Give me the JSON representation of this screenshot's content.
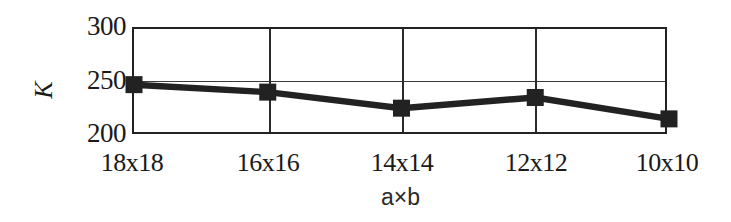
{
  "chart_data": {
    "type": "line",
    "title": "",
    "subtitle": "",
    "xlabel": "a×b",
    "ylabel": "K",
    "categories": [
      "18x18",
      "16x16",
      "14x14",
      "12x12",
      "10x10"
    ],
    "series": [
      {
        "name": "K",
        "values": [
          248,
          241,
          226,
          236,
          216
        ],
        "marker": "filled-square",
        "line_color": "#222222",
        "marker_color": "#222222"
      }
    ],
    "ylim": [
      200,
      300
    ],
    "yticks": [
      200,
      250,
      300
    ],
    "ytick_labels": [
      "200",
      "250",
      "300"
    ],
    "grid": {
      "horizontal": true,
      "vertical": true,
      "horizontal_values": [
        250
      ],
      "vertical_categories": [
        "16x16",
        "14x14",
        "12x12"
      ]
    },
    "legend": null,
    "frame": true,
    "annotations": []
  },
  "axes": {
    "y_title": "K",
    "x_title": "a×b",
    "y_tick_300": "300",
    "y_tick_250": "250",
    "y_tick_200": "200",
    "x_tick_0": "18x18",
    "x_tick_1": "16x16",
    "x_tick_2": "14x14",
    "x_tick_3": "12x12",
    "x_tick_4": "10x10"
  },
  "style": {
    "line_color": "#222222",
    "marker_color": "#222222",
    "frame_color": "#222222",
    "grid_color": "#2b2b2b",
    "background": "#ffffff",
    "text_color": "#1a1a1a"
  }
}
